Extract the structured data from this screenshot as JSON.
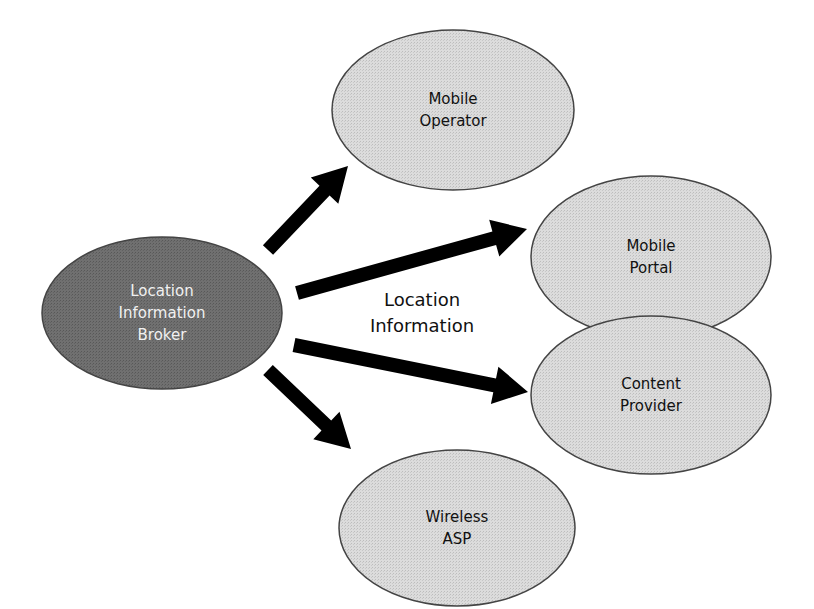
{
  "colors": {
    "background": "#ffffff",
    "broker_fill": "#6e6e6e",
    "broker_text": "#f0f0f0",
    "node_fill": "#d9d9d9",
    "node_stroke": "#444444",
    "node_text": "#111111",
    "arrow": "#000000"
  },
  "source_node": {
    "id": "broker",
    "lines": [
      "Location",
      "Information",
      "Broker"
    ],
    "cx": 162,
    "cy": 313,
    "rx": 120,
    "ry": 76
  },
  "edge_label": {
    "lines": [
      "Location",
      "Information"
    ],
    "x": 422,
    "y": 306
  },
  "target_nodes": [
    {
      "id": "mobile-operator",
      "lines": [
        "Mobile",
        "Operator"
      ],
      "cx": 453,
      "cy": 110,
      "rx": 121,
      "ry": 80
    },
    {
      "id": "mobile-portal",
      "lines": [
        "Mobile",
        "Portal"
      ],
      "cx": 651,
      "cy": 257,
      "rx": 120,
      "ry": 81
    },
    {
      "id": "content-provider",
      "lines": [
        "Content",
        "Provider"
      ],
      "cx": 651,
      "cy": 395,
      "rx": 120,
      "ry": 79
    },
    {
      "id": "wireless-asp",
      "lines": [
        "Wireless",
        "ASP"
      ],
      "cx": 457,
      "cy": 528,
      "rx": 118,
      "ry": 78
    }
  ],
  "edges": [
    {
      "from": "broker",
      "to": "mobile-operator",
      "x1": 268,
      "y1": 250,
      "x2": 348,
      "y2": 166
    },
    {
      "from": "broker",
      "to": "mobile-portal",
      "x1": 297,
      "y1": 293,
      "x2": 527,
      "y2": 229
    },
    {
      "from": "broker",
      "to": "content-provider",
      "x1": 294,
      "y1": 345,
      "x2": 528,
      "y2": 392
    },
    {
      "from": "broker",
      "to": "wireless-asp",
      "x1": 268,
      "y1": 370,
      "x2": 351,
      "y2": 449
    }
  ]
}
